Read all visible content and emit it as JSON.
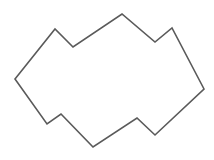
{
  "canvas": {
    "width": 214,
    "height": 160,
    "background": "#ffffff"
  },
  "polygon": {
    "stroke": "#5a5a5a",
    "stroke_width": 1.6,
    "fill": "none",
    "points": [
      [
        15,
        79
      ],
      [
        55,
        29
      ],
      [
        73,
        47
      ],
      [
        122,
        14
      ],
      [
        155,
        42
      ],
      [
        172,
        28
      ],
      [
        204,
        89
      ],
      [
        155,
        135
      ],
      [
        137,
        118
      ],
      [
        93,
        147
      ],
      [
        61,
        114
      ],
      [
        47,
        124
      ]
    ]
  }
}
